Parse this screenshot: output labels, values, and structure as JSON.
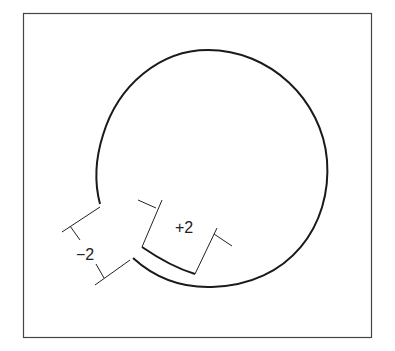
{
  "diagram": {
    "frame": {
      "stroke": "#444444"
    },
    "shape": {
      "type": "circle-with-notch",
      "stroke": "#1a1a1a"
    },
    "dimensions": [
      {
        "label": "+2",
        "description": "offset of inner arc segment"
      },
      {
        "label": "−2",
        "description": "gap width at notch"
      }
    ]
  }
}
